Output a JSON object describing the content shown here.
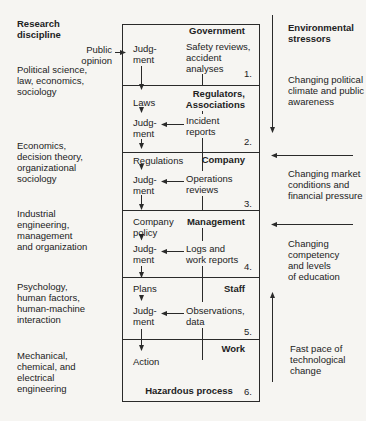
{
  "colors": {
    "background": "#f6f5f2",
    "ink": "#222222"
  },
  "left_column": {
    "header": "Research\ndiscipline",
    "public_opinion": "Public\nopinion",
    "disciplines": [
      "Political science,\nlaw, economics,\nsociology",
      "Economics,\ndecision theory,\norganizational\nsociology",
      "Industrial\nengineering,\nmanagement\nand organization",
      "Psychology,\nhuman factors,\nhuman-machine\ninteraction",
      "Mechanical,\nchemical, and\nelectrical\nengineering"
    ]
  },
  "system": {
    "levels": [
      {
        "number": "1.",
        "title": "Government",
        "judgment": "Judg-\nment",
        "feedback": "Safety reviews,\naccident\nanalyses"
      },
      {
        "number": "2.",
        "title": "Regulators,\nAssociations",
        "directive": "Laws",
        "judgment": "Judg-\nment",
        "feedback": "Incident\nreports"
      },
      {
        "number": "3.",
        "title": "Company",
        "directive": "Regulations",
        "judgment": "Judg-\nment",
        "feedback": "Operations\nreviews"
      },
      {
        "number": "4.",
        "title": "Management",
        "directive": "Company\npolicy",
        "judgment": "Judg-\nment",
        "feedback": "Logs and\nwork reports"
      },
      {
        "number": "5.",
        "title": "Staff",
        "directive": "Plans",
        "judgment": "Judg-\nment",
        "feedback": "Observations,\ndata"
      },
      {
        "number": "6.",
        "title": "Work",
        "directive": "Action",
        "footer": "Hazardous process"
      }
    ]
  },
  "right_column": {
    "header": "Environmental\nstressors",
    "stressors": [
      "Changing political\nclimate and public\nawareness",
      "Changing market\nconditions and\nfinancial pressure",
      "Changing\ncompetency\nand levels\nof education",
      "Fast pace of\ntechnological\nchange"
    ]
  }
}
